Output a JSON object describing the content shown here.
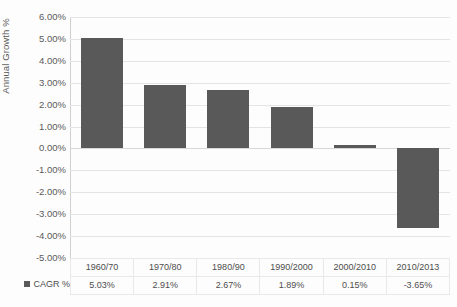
{
  "chart_data": {
    "type": "bar",
    "title": "",
    "xlabel": "",
    "ylabel": "Annual Growth %",
    "categories": [
      "1960/70",
      "1970/80",
      "1980/90",
      "1990/2000",
      "2000/2010",
      "2010/2013"
    ],
    "values": [
      5.03,
      2.91,
      2.67,
      1.89,
      0.15,
      -3.65
    ],
    "value_labels": [
      "5.03%",
      "2.91%",
      "2.67%",
      "1.89%",
      "0.15%",
      "-3.65%"
    ],
    "series": [
      {
        "name": "CAGR %",
        "values": [
          5.03,
          2.91,
          2.67,
          1.89,
          0.15,
          -3.65
        ]
      }
    ],
    "ylim": [
      -5.0,
      6.0
    ],
    "ytick_labels": [
      "6.00%",
      "5.00%",
      "4.00%",
      "3.00%",
      "2.00%",
      "1.00%",
      "0.00%",
      "-1.00%",
      "-2.00%",
      "-3.00%",
      "-4.00%",
      "-5.00%"
    ],
    "ytick_values": [
      6.0,
      5.0,
      4.0,
      3.0,
      2.0,
      1.0,
      0.0,
      -1.0,
      -2.0,
      -3.0,
      -4.0,
      -5.0
    ],
    "grid": true,
    "legend_position": "bottom-left",
    "show_data_table": true,
    "bar_color": "#595959",
    "gridline_color": "#e4e4e4"
  },
  "legend": {
    "series_label": "CAGR %"
  }
}
